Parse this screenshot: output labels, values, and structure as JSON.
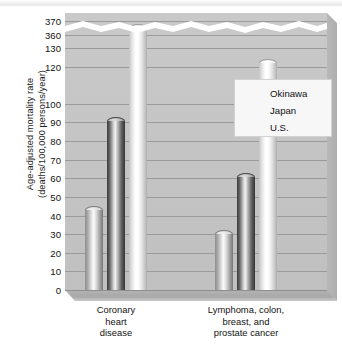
{
  "chart_data": {
    "type": "bar",
    "title": "",
    "subtitle": "",
    "xlabel": "",
    "ylabel": "Age-adjusted mortality rate (deaths/100,000 persons/year)",
    "ylabel_lines": [
      "Age-adjusted mortality rate",
      "(deaths/100,000 persons/year)"
    ],
    "categories": [
      "Coronary heart disease",
      "Lymphoma, colon, breast, and prostate cancer"
    ],
    "category_label_lines": [
      [
        "Coronary",
        "heart",
        "disease"
      ],
      [
        "Lymphoma, colon,",
        "breast, and",
        "prostate cancer"
      ]
    ],
    "series": [
      {
        "name": "Okinawa",
        "values": [
          45,
          32
        ],
        "color": "#b0b0b0"
      },
      {
        "name": "Japan",
        "values": [
          93,
          63
        ],
        "color": "#555555"
      },
      {
        "name": "U.S.",
        "values": [
          368,
          124
        ],
        "color": "#f2f2f2"
      }
    ],
    "ytick_labels": [
      "370",
      "360",
      "130",
      "120",
      "100",
      "90",
      "80",
      "70",
      "60",
      "50",
      "40",
      "30",
      "20",
      "10",
      "0"
    ],
    "ytick_values": [
      370,
      360,
      130,
      120,
      100,
      90,
      80,
      70,
      60,
      50,
      40,
      30,
      20,
      10,
      0
    ],
    "axis_break": {
      "present": true,
      "between": [
        130,
        360
      ],
      "style": "white-zigzag-band"
    },
    "ylim": [
      0,
      370
    ],
    "grid": true,
    "legend_position": "inside-upper-center",
    "plot_background": "#c5c5c5",
    "gridline_color": "#8e8e8e",
    "style": "3d-cylinder-bars"
  },
  "legend": {
    "items": [
      {
        "label": "Okinawa"
      },
      {
        "label": "Japan"
      },
      {
        "label": "U.S."
      }
    ]
  }
}
